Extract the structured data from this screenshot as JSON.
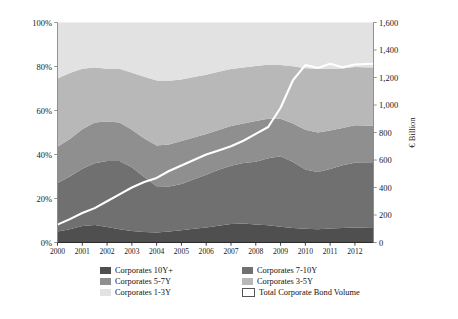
{
  "chart_data": {
    "type": "area",
    "title": "",
    "subtitle": "",
    "xlabel": "",
    "ylabel": "",
    "ylabel_right": "€ Billion",
    "grid": false,
    "legend_position": "bottom",
    "x": [
      2000,
      2000.5,
      2001,
      2001.5,
      2002,
      2002.5,
      2003,
      2003.5,
      2004,
      2004.5,
      2005,
      2005.5,
      2006,
      2006.5,
      2007,
      2007.5,
      2008,
      2008.5,
      2009,
      2009.5,
      2010,
      2010.5,
      2011,
      2011.5,
      2012,
      2012.75
    ],
    "xticklabels": [
      "2000",
      "2001",
      "2002",
      "2003",
      "2004",
      "2005",
      "2006",
      "2007",
      "2008",
      "2009",
      "2010",
      "2011",
      "2012"
    ],
    "ylim": [
      0,
      100
    ],
    "yticklabels": [
      "0%",
      "20%",
      "40%",
      "60%",
      "80%",
      "100%"
    ],
    "yticks": [
      0,
      20,
      40,
      60,
      80,
      100
    ],
    "ylim_right": [
      0,
      1600
    ],
    "yticklabels_right": [
      "0",
      "200",
      "400",
      "600",
      "800",
      "1,000",
      "1,200",
      "1,400",
      "1,600"
    ],
    "yticks_right": [
      0,
      200,
      400,
      600,
      800,
      1000,
      1200,
      1400,
      1600
    ],
    "series": [
      {
        "name": "Corporates 10Y+",
        "color": "#4f4f4f",
        "values": [
          5.0,
          6.0,
          7.5,
          8.0,
          7.0,
          6.0,
          5.2,
          4.8,
          4.6,
          5.0,
          5.6,
          6.2,
          6.8,
          7.6,
          8.4,
          8.6,
          8.2,
          7.8,
          7.2,
          6.6,
          6.2,
          6.0,
          6.4,
          6.6,
          6.8,
          6.6
        ]
      },
      {
        "name": "Corporates 7-10Y",
        "color": "#707070",
        "values": [
          22.0,
          24.0,
          26.0,
          28.0,
          30.0,
          31.0,
          29.0,
          25.0,
          21.0,
          20.5,
          21.0,
          22.5,
          24.0,
          25.5,
          26.5,
          27.5,
          28.5,
          30.5,
          32.0,
          30.0,
          27.0,
          26.0,
          27.0,
          28.5,
          29.5,
          29.5
        ]
      },
      {
        "name": "Corporates 5-7Y",
        "color": "#8f8f8f",
        "values": [
          16.5,
          17.0,
          18.0,
          18.5,
          18.0,
          17.5,
          17.0,
          17.5,
          18.5,
          19.0,
          19.5,
          19.0,
          18.5,
          18.0,
          18.0,
          18.0,
          18.5,
          18.0,
          17.0,
          17.5,
          18.0,
          18.0,
          17.5,
          17.0,
          17.0,
          17.0
        ]
      },
      {
        "name": "Corporates 3-5Y",
        "color": "#b8b8b8",
        "values": [
          31.0,
          30.0,
          27.5,
          25.0,
          24.0,
          24.5,
          26.0,
          28.0,
          29.5,
          29.0,
          28.0,
          27.5,
          27.0,
          26.5,
          26.0,
          25.5,
          25.0,
          24.5,
          24.5,
          26.0,
          28.0,
          29.0,
          28.0,
          27.0,
          26.5,
          26.5
        ]
      },
      {
        "name": "Corporates 1-3Y",
        "color": "#e2e2e2",
        "values": [
          25.5,
          23.0,
          21.0,
          20.5,
          21.0,
          21.0,
          22.8,
          24.7,
          26.4,
          26.5,
          25.9,
          24.8,
          23.7,
          22.4,
          21.1,
          20.4,
          19.8,
          19.2,
          19.3,
          19.9,
          20.8,
          21.0,
          21.1,
          20.9,
          20.2,
          20.4
        ]
      }
    ],
    "line_series": {
      "name": "Total Corporate Bond Volume",
      "color": "#ffffff",
      "unit": "€ Billion",
      "axis": "right",
      "values": [
        130,
        170,
        215,
        250,
        300,
        350,
        400,
        440,
        470,
        520,
        560,
        600,
        640,
        670,
        700,
        740,
        790,
        840,
        980,
        1180,
        1290,
        1270,
        1300,
        1275,
        1295,
        1300
      ]
    }
  },
  "legend": {
    "column_left": [
      {
        "label": "Corporates 10Y+",
        "swatch": "#4f4f4f",
        "style": "solid"
      },
      {
        "label": "Corporates 5-7Y",
        "swatch": "#8f8f8f",
        "style": "solid"
      },
      {
        "label": "Corporates 1-3Y",
        "swatch": "#e2e2e2",
        "style": "solid"
      }
    ],
    "column_right": [
      {
        "label": "Corporates 7-10Y",
        "swatch": "#707070",
        "style": "solid"
      },
      {
        "label": "Corporates 3-5Y",
        "swatch": "#b8b8b8",
        "style": "solid"
      },
      {
        "label": "Total Corporate Bond Volume",
        "swatch": "#ffffff",
        "style": "outline"
      }
    ]
  },
  "axes": {
    "left_title": "",
    "right_title": "€ Billion"
  }
}
